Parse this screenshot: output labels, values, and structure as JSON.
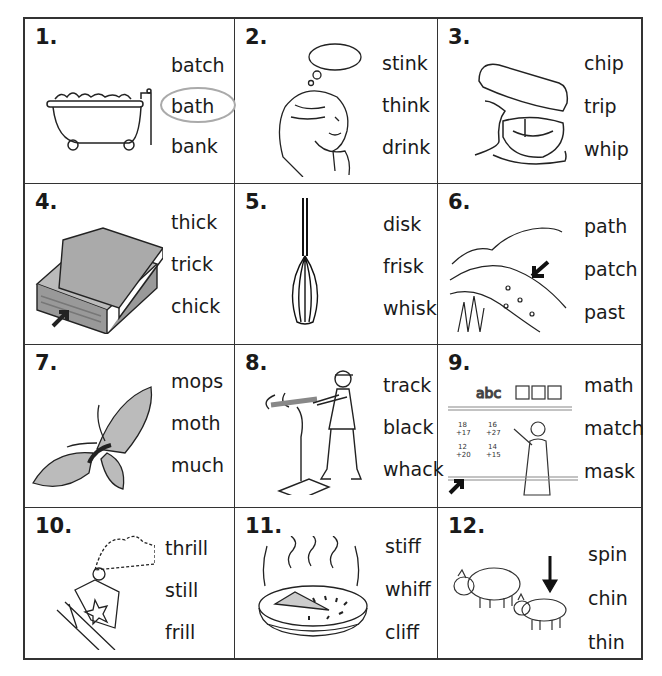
{
  "worksheet": {
    "items": [
      {
        "number": "1.",
        "picture": "bathtub",
        "words": [
          "batch",
          "bath",
          "bank"
        ],
        "circled": 1
      },
      {
        "number": "2.",
        "picture": "girl-thinking",
        "words": [
          "stink",
          "think",
          "drink"
        ],
        "circled": null
      },
      {
        "number": "3.",
        "picture": "stand-mixer",
        "words": [
          "chip",
          "trip",
          "whip"
        ],
        "circled": null
      },
      {
        "number": "4.",
        "picture": "thick-books",
        "words": [
          "thick",
          "trick",
          "chick"
        ],
        "circled": null
      },
      {
        "number": "5.",
        "picture": "whisk",
        "words": [
          "disk",
          "frisk",
          "whisk"
        ],
        "circled": null
      },
      {
        "number": "6.",
        "picture": "path",
        "words": [
          "path",
          "patch",
          "past"
        ],
        "circled": null
      },
      {
        "number": "7.",
        "picture": "moth",
        "words": [
          "mops",
          "moth",
          "much"
        ],
        "circled": null
      },
      {
        "number": "8.",
        "picture": "batter-hitting-tee",
        "words": [
          "track",
          "black",
          "whack"
        ],
        "circled": null
      },
      {
        "number": "9.",
        "picture": "teacher-math-board",
        "words": [
          "math",
          "match",
          "mask"
        ],
        "circled": null
      },
      {
        "number": "10.",
        "picture": "roller-coaster",
        "words": [
          "thrill",
          "still",
          "frill"
        ],
        "circled": null
      },
      {
        "number": "11.",
        "picture": "steaming-pie",
        "words": [
          "stiff",
          "whiff",
          "cliff"
        ],
        "circled": null
      },
      {
        "number": "12.",
        "picture": "pigs",
        "words": [
          "spin",
          "chin",
          "thin"
        ],
        "circled": null
      }
    ],
    "board_text": "abc",
    "math_problems": [
      "18 +17",
      "16 +27",
      "12 +20",
      "14 +15"
    ],
    "colors": {
      "line": "#333333",
      "circle": "#aaaaaa",
      "text": "#1a1a1a"
    }
  }
}
